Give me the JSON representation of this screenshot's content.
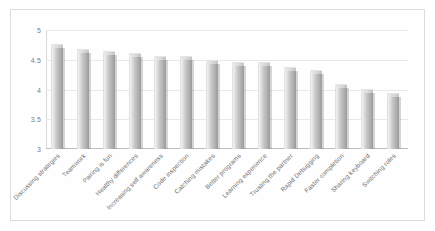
{
  "chart_data": {
    "type": "bar",
    "title": "",
    "subtitle": "",
    "xlabel": "",
    "ylabel": "",
    "ylim": [
      3,
      5
    ],
    "yticks": [
      "3",
      "3.5",
      "4",
      "4.5",
      "5"
    ],
    "ytick_values": [
      3,
      3.5,
      4,
      4.5,
      5
    ],
    "grid": true,
    "legend": false,
    "legend_position": "none",
    "orientation": "vertical",
    "categories": [
      "Discussing strategies",
      "Teamwork",
      "Pairing is fun",
      "Healthy differences",
      "Increasing self awareness",
      "Code inspection",
      "Catching mistakes",
      "Better programs",
      "Learning experience",
      "Trusting the partner",
      "Rapid Debugging",
      "Faster completion",
      "Sharing keyboard",
      "Switching roles"
    ],
    "values": [
      4.75,
      4.66,
      4.63,
      4.59,
      4.55,
      4.55,
      4.48,
      4.45,
      4.44,
      4.36,
      4.31,
      4.08,
      4.0,
      3.92
    ]
  },
  "figure": {
    "bar_color": "#c9c9c9",
    "grid_color": "#e9e9e9",
    "axis_color": "#bdbdbd",
    "tick_label_color": "#7d7d7d",
    "background": "#ffffff",
    "frame_color": "#dcdcdc"
  }
}
